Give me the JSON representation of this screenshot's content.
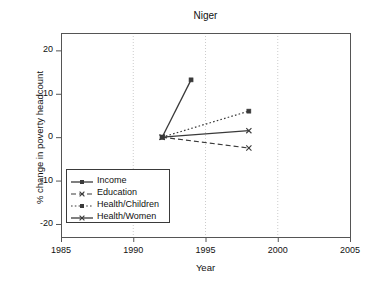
{
  "chart_data": {
    "type": "line",
    "title": "Niger",
    "xlabel": "Year",
    "ylabel": "% change in poverty headcount",
    "xlim": [
      1985,
      2005
    ],
    "ylim": [
      -23,
      24
    ],
    "xticks": [
      1985,
      1990,
      1995,
      2000,
      2005
    ],
    "yticks": [
      20,
      10,
      0,
      -10,
      -20
    ],
    "xtick_labels": [
      "1985",
      "1990",
      "1995",
      "2000",
      "2005"
    ],
    "ytick_labels": [
      "20",
      "10",
      "0",
      "-10",
      "-20"
    ],
    "grid": "vertical-dotted-at-xticks",
    "legend_position": "lower-left-inside",
    "series": [
      {
        "name": "Income",
        "linestyle": "solid",
        "marker": "square",
        "x": [
          1992,
          1994
        ],
        "y": [
          0,
          13.2
        ]
      },
      {
        "name": "Education",
        "linestyle": "dashed",
        "marker": "x",
        "x": [
          1992,
          1998
        ],
        "y": [
          0,
          -2.5
        ]
      },
      {
        "name": "Health/Children",
        "linestyle": "dotted",
        "marker": "square",
        "x": [
          1992,
          1998
        ],
        "y": [
          0,
          6.0
        ]
      },
      {
        "name": "Health/Women",
        "linestyle": "solid",
        "marker": "x",
        "x": [
          1992,
          1998
        ],
        "y": [
          0,
          1.5
        ]
      }
    ]
  },
  "colors": {
    "line": "#3a3a3a",
    "axis": "#555555",
    "grid": "#cccccc",
    "text": "#111111",
    "background": "#ffffff"
  },
  "legend": {
    "items": [
      {
        "label": "Income"
      },
      {
        "label": "Education"
      },
      {
        "label": "Health/Children"
      },
      {
        "label": "Health/Women"
      }
    ]
  }
}
